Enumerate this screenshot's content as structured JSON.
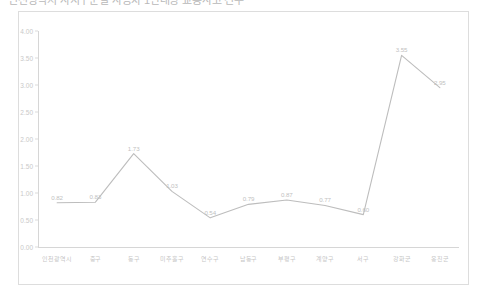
{
  "title": "인천광역시 자치구군별 자동차 1만대당 교통사고 건수",
  "chart_data": {
    "type": "line",
    "title": "인천광역시 자치구군별 자동차 1만대당 교통사고 건수",
    "xlabel": "",
    "ylabel": "",
    "ylim": [
      0.0,
      4.0
    ],
    "yticks": [
      "0.00",
      "0.50",
      "1.00",
      "1.50",
      "2.00",
      "2.50",
      "3.00",
      "3.50",
      "4.00"
    ],
    "ytick_values": [
      0.0,
      0.5,
      1.0,
      1.5,
      2.0,
      2.5,
      3.0,
      3.5,
      4.0
    ],
    "grid": false,
    "legend": "none",
    "categories": [
      "인천광역시",
      "중구",
      "동구",
      "미추홀구",
      "연수구",
      "남동구",
      "부평구",
      "계양구",
      "서구",
      "강화군",
      "옹진군"
    ],
    "values": [
      0.82,
      0.83,
      1.73,
      1.03,
      0.54,
      0.79,
      0.87,
      0.77,
      0.6,
      3.55,
      2.95
    ],
    "value_labels": [
      "0.82",
      "0.83",
      "1.73",
      "1.03",
      "0.54",
      "0.79",
      "0.87",
      "0.77",
      "0.60",
      "3.55",
      "2.95"
    ],
    "line_color": "#bdbdbd"
  }
}
